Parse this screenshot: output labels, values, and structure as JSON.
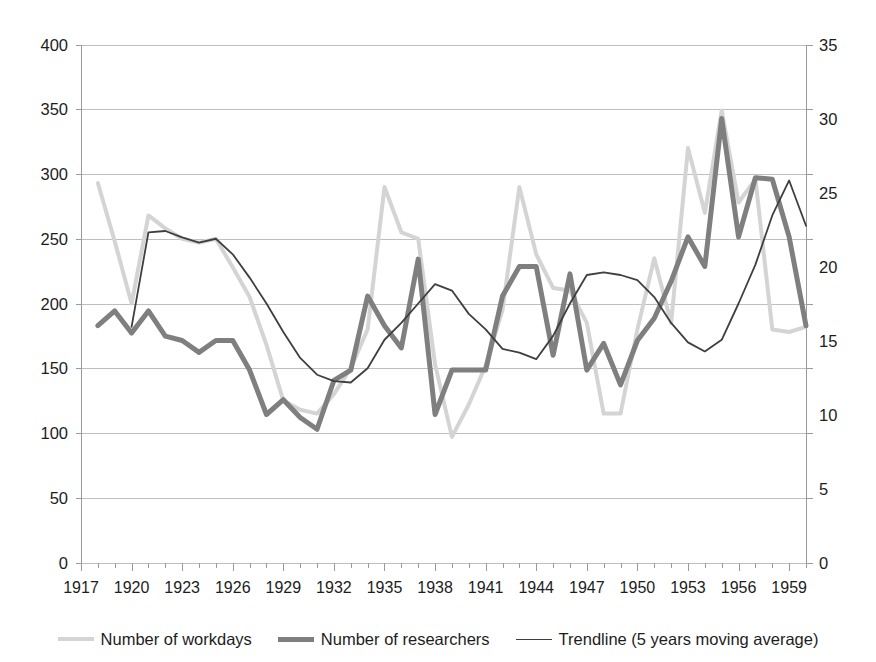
{
  "page": {
    "clipped_header_text": "",
    "background": "#ffffff"
  },
  "legend": {
    "position": "bottom-center",
    "items": [
      {
        "label": "Number of workdays",
        "color": "#d4d4d4",
        "width": 4,
        "icon": "line-swatch-icon"
      },
      {
        "label": "Number of researchers",
        "color": "#7f7f7f",
        "width": 5,
        "icon": "line-swatch-icon"
      },
      {
        "label": "Trendline (5 years moving average)",
        "color": "#3f3f3f",
        "width": 1.8,
        "icon": "line-swatch-icon"
      }
    ]
  },
  "chart_data": {
    "type": "line",
    "title": "",
    "subtitle": "",
    "xlabel": "",
    "ylabel": "",
    "grid": true,
    "legend_position": "bottom",
    "xlim": [
      1917,
      1960
    ],
    "x_tick_step": 3,
    "x_ticks": [
      1917,
      1920,
      1923,
      1926,
      1929,
      1932,
      1935,
      1938,
      1941,
      1944,
      1947,
      1950,
      1953,
      1956,
      1959
    ],
    "x_minor_tick_step": 1,
    "y_left": {
      "label": "Number of workdays",
      "ylim": [
        0,
        400
      ],
      "ticks": [
        0,
        50,
        100,
        150,
        200,
        250,
        300,
        350,
        400
      ]
    },
    "y_right": {
      "label": "Number of researchers",
      "ylim": [
        0,
        35
      ],
      "ticks": [
        0,
        5,
        10,
        15,
        20,
        25,
        30,
        35
      ]
    },
    "x": [
      1917,
      1918,
      1919,
      1920,
      1921,
      1922,
      1923,
      1924,
      1925,
      1926,
      1927,
      1928,
      1929,
      1930,
      1931,
      1932,
      1933,
      1934,
      1935,
      1936,
      1937,
      1938,
      1939,
      1940,
      1941,
      1942,
      1943,
      1944,
      1945,
      1946,
      1947,
      1948,
      1949,
      1950,
      1951,
      1952,
      1953,
      1954,
      1955,
      1956,
      1957,
      1958,
      1959,
      1960
    ],
    "series": [
      {
        "name": "Number of workdays",
        "axis": "left",
        "color": "#d4d4d4",
        "width": 4,
        "values": [
          null,
          293,
          248,
          200,
          268,
          258,
          250,
          247,
          250,
          228,
          205,
          168,
          125,
          118,
          115,
          130,
          150,
          180,
          290,
          255,
          250,
          153,
          97,
          122,
          152,
          195,
          290,
          238,
          212,
          210,
          185,
          115,
          115,
          180,
          235,
          185,
          320,
          270,
          349,
          278,
          296,
          180,
          178,
          182
        ]
      },
      {
        "name": "Number of researchers",
        "axis": "right",
        "color": "#7f7f7f",
        "width": 5,
        "values": [
          null,
          16.0,
          17.0,
          15.5,
          17.0,
          15.3,
          15.0,
          14.2,
          15.0,
          15.0,
          13.0,
          10.0,
          11.0,
          9.8,
          9.0,
          12.3,
          13.0,
          18.0,
          16.0,
          14.5,
          20.5,
          10.0,
          13.0,
          13.0,
          13.0,
          18.0,
          20.0,
          20.0,
          14.0,
          19.5,
          13.0,
          14.8,
          12.0,
          15.0,
          16.5,
          19.0,
          22.0,
          20.0,
          30.0,
          22.0,
          26.0,
          25.9,
          22.0,
          16.0
        ]
      },
      {
        "name": "Trendline (5 years moving average)",
        "axis": "left",
        "color": "#3f3f3f",
        "width": 1.8,
        "values": [
          null,
          null,
          null,
          182,
          255,
          256,
          251,
          247,
          250,
          238,
          220,
          200,
          178,
          158,
          145,
          140,
          139,
          150,
          172,
          185,
          200,
          215,
          210,
          192,
          180,
          165,
          162,
          157,
          175,
          200,
          222,
          224,
          222,
          218,
          205,
          185,
          170,
          163,
          172,
          200,
          230,
          268,
          295,
          260
        ]
      }
    ]
  }
}
